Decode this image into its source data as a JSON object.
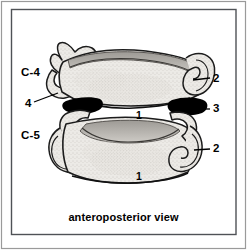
{
  "figure": {
    "title_caption": "anteroposterior view",
    "border": {
      "outer_color": "#8c8c8c",
      "inner_color": "#55585c",
      "background": "#ffffff"
    },
    "palette": {
      "bone_fill": "#eceae6",
      "bone_stipple": "#b9b5ae",
      "bone_outline": "#1a1a1a",
      "endplate_shadow": "#b5b2ad",
      "joint_black": "#000000",
      "label_text": "#000000",
      "leader_line": "#000000"
    },
    "level_labels": [
      {
        "id": "c4",
        "text": "C-4",
        "x": 21,
        "y": 67
      },
      {
        "id": "c5",
        "text": "C-5",
        "x": 21,
        "y": 130
      }
    ],
    "callouts": [
      {
        "id": "callout-4-left",
        "text": "4",
        "meaning": "uncinate-process",
        "label_x": 25,
        "label_y": 98,
        "line": {
          "x1": 34,
          "y1": 102,
          "x2": 58,
          "y2": 93
        }
      },
      {
        "id": "callout-2-upper-right",
        "text": "2",
        "meaning": "transverse-process-c4",
        "label_x": 213,
        "label_y": 73,
        "line": {
          "x1": 193,
          "y1": 80,
          "x2": 210,
          "y2": 78
        }
      },
      {
        "id": "callout-3-right",
        "text": "3",
        "meaning": "uncovertebral-joint",
        "label_x": 213,
        "label_y": 103,
        "line": {
          "x1": 196,
          "y1": 109,
          "x2": 210,
          "y2": 109
        }
      },
      {
        "id": "callout-2-lower-right",
        "text": "2",
        "meaning": "transverse-process-c5",
        "label_x": 213,
        "label_y": 143,
        "line": {
          "x1": 194,
          "y1": 150,
          "x2": 210,
          "y2": 149
        }
      }
    ],
    "body_numbers": [
      {
        "id": "body-1-c4",
        "text": "1",
        "meaning": "vertebral-body-c4",
        "x": 136,
        "y": 110
      },
      {
        "id": "body-1-c5",
        "text": "1",
        "meaning": "vertebral-body-c5",
        "x": 136,
        "y": 171
      }
    ]
  }
}
